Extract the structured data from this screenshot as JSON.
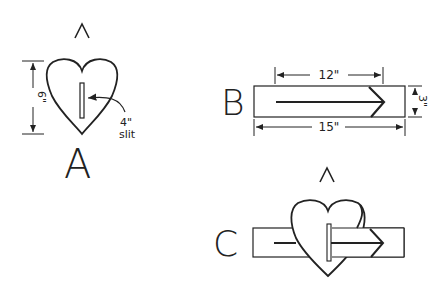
{
  "figures": {
    "A": {
      "label": "A",
      "height_dim": "6\"",
      "slit_label_1": "4\"",
      "slit_label_2": "slit",
      "caret": "^"
    },
    "B": {
      "label": "B",
      "arrow_dim": "12\"",
      "length_dim": "15\"",
      "width_dim": "3\"",
      "caret": "^"
    },
    "C": {
      "label": "C"
    }
  },
  "colors": {
    "stroke": "#222222",
    "background": "#ffffff"
  }
}
